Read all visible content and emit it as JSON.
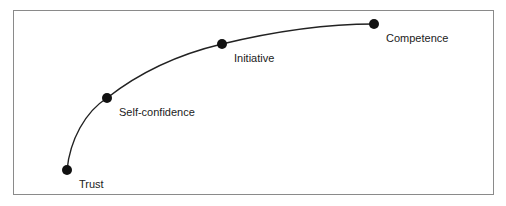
{
  "diagram": {
    "type": "progression-curve",
    "stages": [
      {
        "label": "Trust"
      },
      {
        "label": "Self-confidence"
      },
      {
        "label": "Initiative"
      },
      {
        "label": "Competence"
      }
    ]
  }
}
